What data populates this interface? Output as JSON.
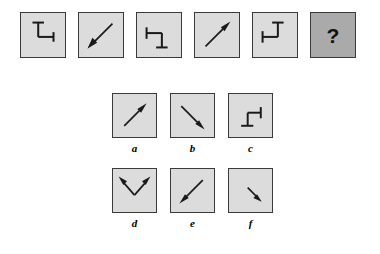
{
  "puzzle": {
    "type": "figural-series-completion",
    "instruction_visible": false,
    "colors": {
      "panel_fill": "#dcdcdc",
      "panel_border": "#3a3a3a",
      "question_fill": "#aaaaaa",
      "figure_stroke": "#1a1a1a",
      "background": "#ffffff"
    },
    "sequence": {
      "name": "stem-sequence",
      "count": 6,
      "items": [
        {
          "index": 1,
          "id": "stem-1",
          "figure": "bracket",
          "figure_name": "bracket-cap-top-left-arm-right",
          "rotation_deg": 0,
          "description": "Horizontal cap at top, vertical stem down, horizontal arm to the right ending in a short vertical cap"
        },
        {
          "index": 2,
          "id": "stem-2",
          "figure": "arrow",
          "figure_name": "arrow-diagonal-down-left",
          "direction": "down-left",
          "rotation_deg": 225,
          "description": "Single-headed diagonal arrow pointing toward the lower-left corner"
        },
        {
          "index": 3,
          "id": "stem-3",
          "figure": "bracket",
          "figure_name": "bracket-cap-left-arm-down",
          "rotation_deg": 90,
          "description": "Vertical cap at left, horizontal arm right, vertical stem down, horizontal cap at bottom"
        },
        {
          "index": 4,
          "id": "stem-4",
          "figure": "arrow",
          "figure_name": "arrow-diagonal-up-right",
          "direction": "up-right",
          "rotation_deg": 45,
          "description": "Single-headed diagonal arrow pointing toward the upper-right corner"
        },
        {
          "index": 5,
          "id": "stem-5",
          "figure": "bracket",
          "figure_name": "bracket-cap-left-arm-up",
          "rotation_deg": 180,
          "description": "Vertical cap at left, horizontal arm right, vertical stem up, horizontal cap at top"
        },
        {
          "index": 6,
          "id": "stem-6-question",
          "figure": "question-mark",
          "figure_name": "question-mark",
          "label": "?",
          "is_missing": true,
          "description": "Missing element, shown as a darker grey panel with a bold question mark"
        }
      ]
    },
    "options": {
      "name": "answer-options",
      "count": 6,
      "rows": [
        {
          "row": 1,
          "items": [
            {
              "letter": "a",
              "id": "option-a",
              "figure": "arrow",
              "figure_name": "arrow-diagonal-up-right",
              "direction": "up-right",
              "description": "Single-headed diagonal arrow pointing to the upper-right"
            },
            {
              "letter": "b",
              "id": "option-b",
              "figure": "arrow",
              "figure_name": "arrow-diagonal-down-right",
              "direction": "down-right",
              "description": "Single-headed diagonal arrow pointing to the lower-right"
            },
            {
              "letter": "c",
              "id": "option-c",
              "figure": "bracket",
              "figure_name": "bracket-cap-right-arm-down",
              "rotation_deg": 270,
              "description": "Vertical cap at right, horizontal arm left, vertical stem down, horizontal cap at bottom"
            }
          ]
        },
        {
          "row": 2,
          "items": [
            {
              "letter": "d",
              "id": "option-d",
              "figure": "double-arrow",
              "figure_name": "double-headed-v-arrow-up",
              "direction": "up-left-and-up-right",
              "description": "V shape with arrowheads at both upper ends"
            },
            {
              "letter": "e",
              "id": "option-e",
              "figure": "arrow",
              "figure_name": "arrow-diagonal-down-left",
              "direction": "down-left",
              "description": "Single-headed diagonal arrow pointing to the lower-left"
            },
            {
              "letter": "f",
              "id": "option-f",
              "figure": "arrow",
              "figure_name": "arrow-short-diagonal-down-right",
              "direction": "down-right",
              "description": "Short single-headed diagonal arrow pointing to the lower-right, placed in the lower-right region"
            }
          ]
        }
      ]
    }
  }
}
